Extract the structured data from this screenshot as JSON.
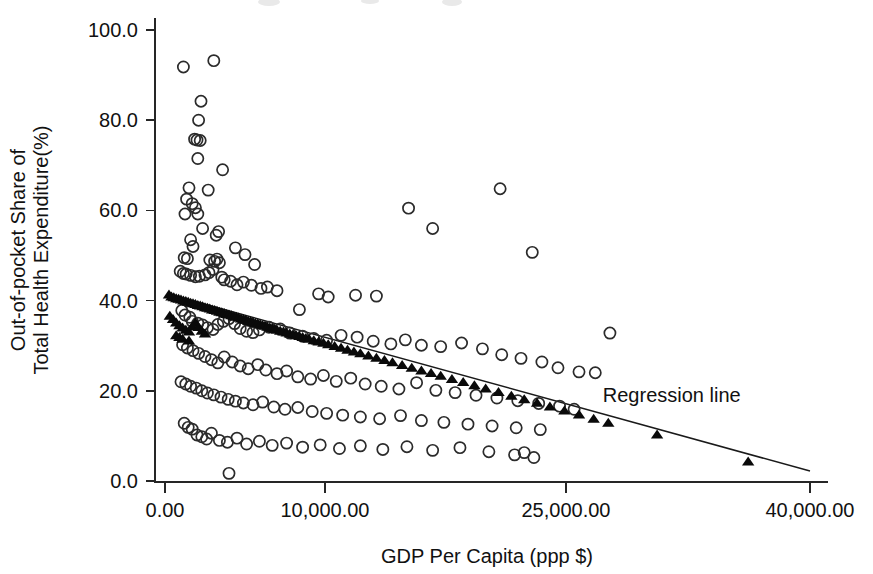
{
  "chart_data": {
    "type": "scatter",
    "title": "",
    "xlabel": "GDP Per Capita (ppp $)",
    "ylabel_line1": "Out-of-pocket Share of",
    "ylabel_line2": "Total Health Expenditure(%)",
    "xlim": [
      0,
      40000
    ],
    "ylim": [
      0,
      100
    ],
    "xticks": [
      0,
      10000,
      25000,
      40000
    ],
    "xtick_labels": [
      "0.00",
      "10,000.00",
      "25,000.00",
      "40,000.00"
    ],
    "yticks": [
      0,
      20,
      40,
      60,
      80,
      100
    ],
    "ytick_labels": [
      "0.0",
      "20.0",
      "40.0",
      "60.0",
      "80.0",
      "100.0"
    ],
    "grid": false,
    "legend_position": "none",
    "annotations": [
      {
        "text": "Regression line",
        "x": 31500,
        "y": 17.5
      }
    ],
    "series": [
      {
        "name": "Observed (open circle)",
        "marker": "open-circle",
        "color": "#2b2b2b",
        "points": [
          [
            1150,
            91.8
          ],
          [
            3050,
            93.2
          ],
          [
            2250,
            84.2
          ],
          [
            2100,
            80.0
          ],
          [
            1850,
            75.8
          ],
          [
            2000,
            75.6
          ],
          [
            2200,
            75.5
          ],
          [
            2050,
            71.5
          ],
          [
            3600,
            69.0
          ],
          [
            1500,
            65.0
          ],
          [
            2700,
            64.5
          ],
          [
            1350,
            62.5
          ],
          [
            1700,
            61.5
          ],
          [
            1900,
            60.6
          ],
          [
            1250,
            59.2
          ],
          [
            2050,
            59.2
          ],
          [
            15200,
            60.5
          ],
          [
            20900,
            64.8
          ],
          [
            16700,
            56.0
          ],
          [
            22900,
            50.7
          ],
          [
            2350,
            56.0
          ],
          [
            3200,
            54.5
          ],
          [
            3350,
            55.3
          ],
          [
            1600,
            53.5
          ],
          [
            1750,
            52.0
          ],
          [
            4400,
            51.7
          ],
          [
            5000,
            50.2
          ],
          [
            1200,
            49.5
          ],
          [
            1400,
            49.3
          ],
          [
            2800,
            49.0
          ],
          [
            3100,
            48.7
          ],
          [
            3250,
            49.2
          ],
          [
            3400,
            48.4
          ],
          [
            5600,
            48.0
          ],
          [
            950,
            46.5
          ],
          [
            1150,
            46.0
          ],
          [
            1320,
            45.9
          ],
          [
            1600,
            45.6
          ],
          [
            1900,
            45.3
          ],
          [
            2150,
            45.4
          ],
          [
            2500,
            45.7
          ],
          [
            2750,
            46.2
          ],
          [
            3000,
            46.9
          ],
          [
            3550,
            45.2
          ],
          [
            3700,
            44.6
          ],
          [
            4100,
            44.3
          ],
          [
            4500,
            43.5
          ],
          [
            4900,
            44.1
          ],
          [
            5400,
            43.4
          ],
          [
            6000,
            42.7
          ],
          [
            6400,
            43.0
          ],
          [
            7000,
            42.2
          ],
          [
            9600,
            41.5
          ],
          [
            10200,
            40.8
          ],
          [
            11900,
            41.2
          ],
          [
            13200,
            41.0
          ],
          [
            8400,
            38.0
          ],
          [
            1050,
            37.8
          ],
          [
            1250,
            36.8
          ],
          [
            1550,
            36.3
          ],
          [
            1700,
            35.4
          ],
          [
            2050,
            35.0
          ],
          [
            2350,
            34.6
          ],
          [
            2650,
            34.0
          ],
          [
            3000,
            33.6
          ],
          [
            3300,
            34.7
          ],
          [
            3650,
            35.4
          ],
          [
            4000,
            36.0
          ],
          [
            4350,
            34.9
          ],
          [
            4700,
            33.8
          ],
          [
            5100,
            33.2
          ],
          [
            5500,
            32.9
          ],
          [
            5900,
            33.5
          ],
          [
            6500,
            34.1
          ],
          [
            7200,
            33.7
          ],
          [
            7800,
            32.8
          ],
          [
            8600,
            32.1
          ],
          [
            9300,
            31.6
          ],
          [
            10100,
            31.2
          ],
          [
            11000,
            32.3
          ],
          [
            12000,
            31.9
          ],
          [
            13000,
            31.0
          ],
          [
            14100,
            30.4
          ],
          [
            15000,
            31.3
          ],
          [
            16000,
            30.1
          ],
          [
            17200,
            29.8
          ],
          [
            18500,
            30.6
          ],
          [
            19800,
            29.3
          ],
          [
            21000,
            28.0
          ],
          [
            22200,
            27.2
          ],
          [
            23500,
            26.4
          ],
          [
            24500,
            25.1
          ],
          [
            25800,
            24.2
          ],
          [
            26800,
            24.0
          ],
          [
            27700,
            32.8
          ],
          [
            1100,
            30.2
          ],
          [
            1400,
            29.5
          ],
          [
            1750,
            28.9
          ],
          [
            2100,
            28.3
          ],
          [
            2500,
            27.6
          ],
          [
            2900,
            26.9
          ],
          [
            3300,
            26.2
          ],
          [
            3700,
            27.5
          ],
          [
            4200,
            26.4
          ],
          [
            4700,
            25.5
          ],
          [
            5200,
            24.9
          ],
          [
            5800,
            25.8
          ],
          [
            6300,
            24.6
          ],
          [
            7000,
            23.8
          ],
          [
            7600,
            24.4
          ],
          [
            8300,
            23.1
          ],
          [
            9100,
            22.6
          ],
          [
            9900,
            23.4
          ],
          [
            10700,
            22.1
          ],
          [
            11600,
            22.8
          ],
          [
            12500,
            21.5
          ],
          [
            13500,
            21.0
          ],
          [
            14600,
            20.4
          ],
          [
            15700,
            21.8
          ],
          [
            16900,
            20.1
          ],
          [
            18100,
            19.6
          ],
          [
            19400,
            19.0
          ],
          [
            20700,
            18.4
          ],
          [
            22000,
            17.8
          ],
          [
            23300,
            17.2
          ],
          [
            24600,
            16.6
          ],
          [
            25500,
            15.9
          ],
          [
            1000,
            22.0
          ],
          [
            1300,
            21.5
          ],
          [
            1600,
            21.0
          ],
          [
            1950,
            20.6
          ],
          [
            2300,
            20.0
          ],
          [
            2650,
            19.5
          ],
          [
            3050,
            19.1
          ],
          [
            3500,
            18.6
          ],
          [
            3950,
            18.1
          ],
          [
            4400,
            17.7
          ],
          [
            4900,
            17.3
          ],
          [
            5500,
            16.9
          ],
          [
            6100,
            17.5
          ],
          [
            6800,
            16.4
          ],
          [
            7500,
            15.9
          ],
          [
            8300,
            16.3
          ],
          [
            9200,
            15.4
          ],
          [
            10100,
            15.0
          ],
          [
            11100,
            14.6
          ],
          [
            12200,
            14.2
          ],
          [
            13400,
            13.8
          ],
          [
            14700,
            14.5
          ],
          [
            16000,
            13.4
          ],
          [
            17400,
            13.0
          ],
          [
            18900,
            12.6
          ],
          [
            20400,
            12.2
          ],
          [
            21900,
            11.8
          ],
          [
            23400,
            11.4
          ],
          [
            1200,
            12.8
          ],
          [
            1450,
            11.9
          ],
          [
            1700,
            11.5
          ],
          [
            2000,
            10.2
          ],
          [
            2300,
            9.8
          ],
          [
            2600,
            9.3
          ],
          [
            2900,
            10.6
          ],
          [
            3400,
            9.0
          ],
          [
            3900,
            8.6
          ],
          [
            4500,
            9.5
          ],
          [
            5100,
            8.2
          ],
          [
            5900,
            8.8
          ],
          [
            6700,
            7.9
          ],
          [
            7600,
            8.4
          ],
          [
            8600,
            7.5
          ],
          [
            9700,
            8.0
          ],
          [
            10900,
            7.2
          ],
          [
            12200,
            7.8
          ],
          [
            13600,
            7.0
          ],
          [
            15100,
            7.6
          ],
          [
            16700,
            6.8
          ],
          [
            18400,
            7.4
          ],
          [
            20200,
            6.5
          ],
          [
            21800,
            5.8
          ],
          [
            22400,
            6.3
          ],
          [
            23000,
            5.2
          ],
          [
            4000,
            1.7
          ]
        ]
      },
      {
        "name": "Predicted (filled triangle) / regression markers",
        "marker": "filled-triangle",
        "color": "#0a0a0a",
        "points": [
          [
            250,
            41.2
          ],
          [
            400,
            40.8
          ],
          [
            550,
            40.6
          ],
          [
            700,
            40.4
          ],
          [
            850,
            40.3
          ],
          [
            1000,
            40.1
          ],
          [
            1150,
            39.9
          ],
          [
            1300,
            39.8
          ],
          [
            1450,
            39.6
          ],
          [
            1600,
            39.4
          ],
          [
            1750,
            39.3
          ],
          [
            1900,
            39.1
          ],
          [
            2050,
            38.9
          ],
          [
            2200,
            38.8
          ],
          [
            2350,
            38.6
          ],
          [
            2500,
            38.4
          ],
          [
            2650,
            38.3
          ],
          [
            2800,
            38.1
          ],
          [
            2950,
            37.9
          ],
          [
            3100,
            37.8
          ],
          [
            3250,
            37.6
          ],
          [
            3400,
            37.4
          ],
          [
            3550,
            37.3
          ],
          [
            3700,
            37.1
          ],
          [
            3850,
            36.9
          ],
          [
            4000,
            36.8
          ],
          [
            4150,
            36.6
          ],
          [
            4300,
            36.4
          ],
          [
            4450,
            36.3
          ],
          [
            4600,
            36.1
          ],
          [
            4750,
            35.9
          ],
          [
            4900,
            35.8
          ],
          [
            5050,
            35.6
          ],
          [
            5200,
            35.4
          ],
          [
            5350,
            35.3
          ],
          [
            5500,
            35.1
          ],
          [
            5650,
            34.9
          ],
          [
            5800,
            34.8
          ],
          [
            5950,
            34.6
          ],
          [
            6100,
            34.4
          ],
          [
            6250,
            34.3
          ],
          [
            6400,
            34.1
          ],
          [
            6550,
            33.9
          ],
          [
            6700,
            33.8
          ],
          [
            6850,
            33.6
          ],
          [
            7000,
            33.4
          ],
          [
            7200,
            33.2
          ],
          [
            7400,
            33.0
          ],
          [
            7600,
            32.8
          ],
          [
            7800,
            32.6
          ],
          [
            8000,
            32.4
          ],
          [
            8200,
            32.2
          ],
          [
            8400,
            32.0
          ],
          [
            8600,
            31.8
          ],
          [
            8800,
            31.6
          ],
          [
            9000,
            31.4
          ],
          [
            9300,
            31.1
          ],
          [
            9600,
            30.8
          ],
          [
            9900,
            30.5
          ],
          [
            10200,
            30.2
          ],
          [
            10600,
            29.8
          ],
          [
            11000,
            29.4
          ],
          [
            11400,
            29.0
          ],
          [
            11800,
            28.6
          ],
          [
            12200,
            28.2
          ],
          [
            12700,
            27.7
          ],
          [
            13200,
            27.2
          ],
          [
            13700,
            26.7
          ],
          [
            14200,
            26.2
          ],
          [
            14800,
            25.6
          ],
          [
            15400,
            25.0
          ],
          [
            16000,
            24.4
          ],
          [
            16600,
            23.8
          ],
          [
            17200,
            23.2
          ],
          [
            17900,
            22.5
          ],
          [
            18600,
            21.8
          ],
          [
            19300,
            21.1
          ],
          [
            20000,
            20.4
          ],
          [
            20800,
            19.6
          ],
          [
            21600,
            18.8
          ],
          [
            22400,
            18.0
          ],
          [
            23200,
            17.2
          ],
          [
            24000,
            16.4
          ],
          [
            24900,
            15.5
          ],
          [
            25800,
            14.6
          ],
          [
            26700,
            13.7
          ],
          [
            27600,
            12.8
          ],
          [
            300,
            36.5
          ],
          [
            500,
            35.8
          ],
          [
            700,
            35.0
          ],
          [
            900,
            34.4
          ],
          [
            1100,
            33.9
          ],
          [
            1300,
            33.4
          ],
          [
            1500,
            33.0
          ],
          [
            1700,
            34.2
          ],
          [
            1900,
            35.0
          ],
          [
            2100,
            34.0
          ],
          [
            2300,
            33.2
          ],
          [
            2500,
            32.6
          ],
          [
            700,
            32.2
          ],
          [
            900,
            31.8
          ],
          [
            1100,
            31.4
          ],
          [
            1500,
            31.0
          ],
          [
            30600,
            10.2
          ],
          [
            36200,
            4.2
          ]
        ]
      }
    ],
    "regression_line": {
      "name": "Regression line",
      "x_start": 250,
      "y_start": 41.4,
      "x_end": 40000,
      "y_end": 2.2,
      "color": "#1a1a1a"
    }
  },
  "axes_geometry": {
    "plot_left_px": 155,
    "plot_right_px": 828,
    "plot_top_px": 18,
    "plot_bottom_px": 482,
    "x_px_0": 165,
    "x_px_10000": 325,
    "x_px_25000": 566,
    "x_px_40000": 810,
    "y_px_0": 481,
    "y_px_100": 30
  }
}
